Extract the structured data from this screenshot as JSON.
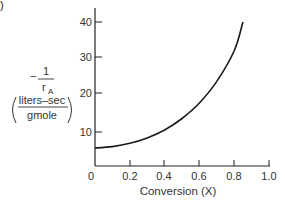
{
  "chart_data": {
    "type": "line",
    "title": "",
    "xlabel": "Conversion (X)",
    "ylabel": "-1/rA (liters-sec/gmole)",
    "ylabel_parts": {
      "sign": "−",
      "numerator": "1",
      "denominator": "r",
      "denominator_sub": "A",
      "units_num": "liters–sec",
      "units_den": "gmole"
    },
    "xlim": [
      0,
      1.0
    ],
    "ylim": [
      0,
      45
    ],
    "x_ticks": [
      "0",
      "0.2",
      "0.4",
      "0.6",
      "0.8",
      "1.0"
    ],
    "y_ticks": [
      "10",
      "20",
      "30",
      "40"
    ],
    "grid": false,
    "legend": null,
    "series": [
      {
        "name": "-1/rA vs X",
        "x": [
          0.0,
          0.1,
          0.2,
          0.3,
          0.4,
          0.5,
          0.6,
          0.7,
          0.8,
          0.85
        ],
        "y": [
          5.0,
          5.4,
          6.3,
          7.8,
          10.0,
          13.2,
          17.5,
          23.5,
          32.0,
          40.0
        ]
      }
    ]
  },
  "figure_label": ")"
}
